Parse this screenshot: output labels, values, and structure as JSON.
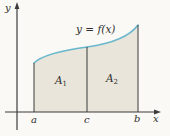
{
  "figure": {
    "curve_equation": "y = f(x)",
    "y_axis_label": "y",
    "x_axis_label": "x",
    "x_ticks": [
      {
        "label": "a"
      },
      {
        "label": "c"
      },
      {
        "label": "b"
      }
    ],
    "regions": [
      {
        "base": "A",
        "sub": "1"
      },
      {
        "base": "A",
        "sub": "2"
      }
    ],
    "colors": {
      "region_fill": "#e9e5da",
      "curve": "#6ab7cd",
      "axis": "#3b3b3b",
      "background": "#faf9f5"
    }
  }
}
